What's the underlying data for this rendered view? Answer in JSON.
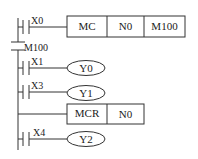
{
  "diagram": {
    "type": "ladder-logic",
    "rungs": [
      {
        "id": "rung-1",
        "contact": {
          "label": "X0",
          "type": "normally-open"
        },
        "instruction": {
          "type": "box",
          "cells": [
            "MC",
            "N0",
            "M100"
          ]
        }
      },
      {
        "id": "master-contact",
        "contact": {
          "label": "M100",
          "type": "normally-open-vertical"
        }
      },
      {
        "id": "rung-2",
        "contact": {
          "label": "X1",
          "type": "normally-open"
        },
        "coil": {
          "label": "Y0"
        }
      },
      {
        "id": "rung-3",
        "contact": {
          "label": "X3",
          "type": "normally-open"
        },
        "coil": {
          "label": "Y1"
        }
      },
      {
        "id": "rung-4",
        "instruction": {
          "type": "box",
          "cells": [
            "MCR",
            "N0"
          ]
        }
      },
      {
        "id": "rung-5",
        "contact": {
          "label": "X4",
          "type": "normally-open"
        },
        "coil": {
          "label": "Y2"
        }
      }
    ]
  },
  "labels": {
    "x0": "X0",
    "mc": "MC",
    "n0": "N0",
    "m100": "M100",
    "m100_contact": "M100",
    "x1": "X1",
    "y0": "Y0",
    "x3": "X3",
    "y1": "Y1",
    "mcr": "MCR",
    "n0_r": "N0",
    "x4": "X4",
    "y2": "Y2"
  },
  "colors": {
    "line": "#333333",
    "text": "#222222",
    "background": "#ffffff"
  }
}
